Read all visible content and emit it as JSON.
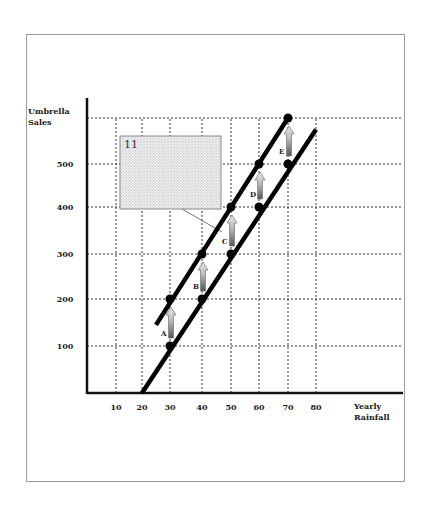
{
  "chart_data": {
    "type": "line",
    "title": "",
    "xlabel": "Yearly Rainfall",
    "ylabel": "Umbrella Sales",
    "xlabel_lines": [
      "Yearly",
      "Rainfall"
    ],
    "ylabel_lines": [
      "Umbrella",
      "Sales"
    ],
    "x_ticks": [
      10,
      20,
      30,
      40,
      50,
      60,
      70,
      80
    ],
    "y_ticks": [
      100,
      200,
      300,
      400,
      500
    ],
    "y_grid": [
      100,
      200,
      300,
      400,
      500,
      600
    ],
    "xlim": [
      0,
      110
    ],
    "ylim": [
      0,
      650
    ],
    "grid": true,
    "grid_style": "dotted",
    "series": [
      {
        "name": "Original demand (lower line)",
        "line_from": [
          20,
          0
        ],
        "line_to": [
          80,
          575
        ],
        "points": [
          [
            30,
            100
          ],
          [
            40,
            200
          ],
          [
            50,
            300
          ],
          [
            60,
            400
          ],
          [
            70,
            500
          ]
        ]
      },
      {
        "name": "Shifted demand (upper line)",
        "line_from": [
          25,
          145
        ],
        "line_to": [
          70,
          600
        ],
        "points": [
          [
            30,
            200
          ],
          [
            40,
            300
          ],
          [
            50,
            400
          ],
          [
            60,
            500
          ],
          [
            70,
            600
          ]
        ]
      }
    ],
    "annotations": [
      {
        "label": "A",
        "x": 30,
        "from": 100,
        "to": 200
      },
      {
        "label": "B",
        "x": 40,
        "from": 200,
        "to": 300
      },
      {
        "label": "C",
        "x": 50,
        "from": 300,
        "to": 400
      },
      {
        "label": "D",
        "x": 60,
        "from": 400,
        "to": 500
      },
      {
        "label": "E",
        "x": 70,
        "from": 500,
        "to": 600
      }
    ],
    "callout": {
      "text": "11",
      "points_to": "C"
    }
  }
}
